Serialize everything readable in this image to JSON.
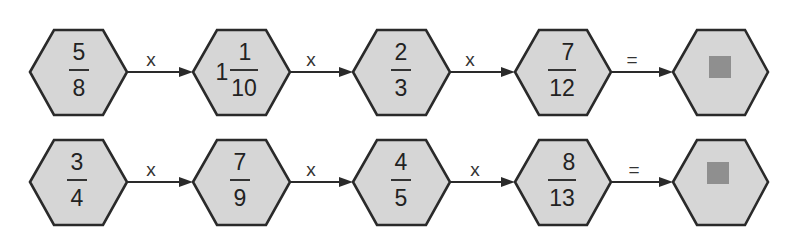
{
  "rows": [
    {
      "terms": [
        {
          "whole": "",
          "numerator": "5",
          "denominator": "8"
        },
        {
          "whole": "1",
          "numerator": "1",
          "denominator": "10"
        },
        {
          "whole": "",
          "numerator": "2",
          "denominator": "3"
        },
        {
          "whole": "",
          "numerator": "7",
          "denominator": "12"
        }
      ],
      "operators": [
        "x",
        "x",
        "x",
        "="
      ],
      "answer": "unknown-box"
    },
    {
      "terms": [
        {
          "whole": "",
          "numerator": "3",
          "denominator": "4"
        },
        {
          "whole": "",
          "numerator": "7",
          "denominator": "9"
        },
        {
          "whole": "",
          "numerator": "4",
          "denominator": "5"
        },
        {
          "whole": "",
          "numerator": "8",
          "denominator": "13"
        }
      ],
      "operators": [
        "x",
        "x",
        "x",
        "="
      ],
      "answer": "unknown-box"
    }
  ],
  "colors": {
    "hex_fill": "#d6d6d6",
    "stroke": "#2a2a2a",
    "answer_box": "#8f8f8f"
  }
}
